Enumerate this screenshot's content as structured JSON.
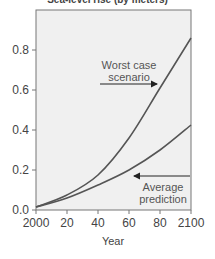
{
  "chart_data": {
    "type": "line",
    "title": "Sea-level rise (by meters)",
    "xlabel": "Year",
    "ylabel": "",
    "x": [
      2000,
      2020,
      2040,
      2060,
      2080,
      2100
    ],
    "x_tick_labels": [
      "2000",
      "20",
      "40",
      "60",
      "80",
      "2100"
    ],
    "y_tick_labels": [
      "0.0",
      "0.2",
      "0.4",
      "0.6",
      "0.8"
    ],
    "xlim": [
      2000,
      2100
    ],
    "ylim": [
      0,
      0.98
    ],
    "grid": false,
    "series": [
      {
        "name": "Worst case scenario",
        "values": [
          0.015,
          0.075,
          0.175,
          0.36,
          0.61,
          0.86
        ],
        "color": "#555555"
      },
      {
        "name": "Average prediction",
        "values": [
          0.015,
          0.06,
          0.125,
          0.2,
          0.3,
          0.425
        ],
        "color": "#555555"
      }
    ],
    "annotations": [
      {
        "text_line1": "Worst case",
        "text_line2": "scenario",
        "arrow": "right"
      },
      {
        "text_line1": "Average",
        "text_line2": "prediction",
        "arrow": "left"
      }
    ],
    "background": "#f0f0f0"
  }
}
